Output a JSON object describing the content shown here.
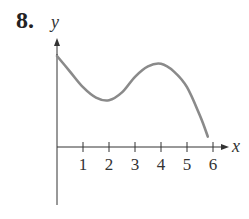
{
  "problem": {
    "number": "8."
  },
  "chart_data": {
    "type": "line",
    "title": "",
    "xlabel": "x",
    "ylabel": "y",
    "x_ticks": [
      "1",
      "2",
      "3",
      "4",
      "5",
      "6"
    ],
    "grid": false,
    "xlim": [
      0,
      6.2
    ],
    "series": [
      {
        "name": "f(x)",
        "color": "#8a8a8a",
        "x": [
          0,
          0.5,
          1,
          1.5,
          2,
          2.5,
          3,
          3.5,
          4,
          4.5,
          5,
          5.5,
          5.8
        ],
        "y": [
          3.5,
          2.9,
          2.3,
          1.9,
          1.8,
          2.1,
          2.7,
          3.1,
          3.2,
          2.9,
          2.3,
          1.2,
          0.4
        ]
      }
    ]
  }
}
